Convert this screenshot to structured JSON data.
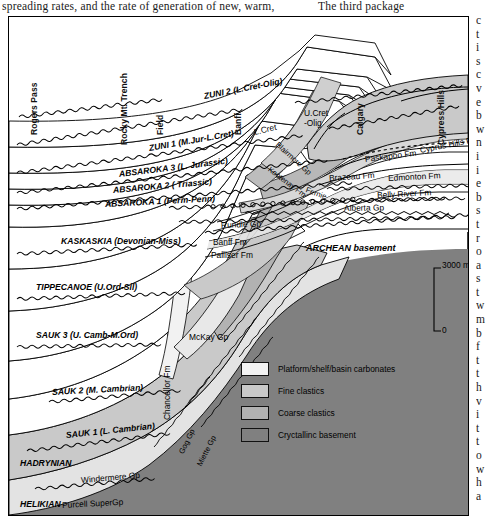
{
  "page": {
    "top_text_left": "spreading rates, and the rate of generation of new, warm,",
    "top_text_right": "The third package",
    "right_column": "c\nt\ni\ns\nc\nv\ne\nb\nw\nn\ni\ni\ne\nb\ns\nt\nr\no\na\ns\nt\nw\nm\nb\nf\nt\nt\nh\nv\ni\nt\nt\no\nw\nh\na"
  },
  "figure": {
    "locations": [
      {
        "label": "Rogers Pass",
        "x": 30,
        "y": 108
      },
      {
        "label": "Rocky Mt. Trench",
        "x": 120,
        "y": 118
      },
      {
        "label": "Field",
        "x": 156,
        "y": 108
      },
      {
        "label": "Banff",
        "x": 234,
        "y": 108
      },
      {
        "label": "Calgary",
        "x": 356,
        "y": 108
      },
      {
        "label": "Cypress Hills",
        "x": 437,
        "y": 118
      }
    ],
    "sequences": [
      {
        "label": "ZUNI 2 (L.Cret-Olig)",
        "x": 195,
        "y": 74,
        "rot": -11
      },
      {
        "label": "ZUNI 1 (M.Jur-L.Cret)",
        "x": 140,
        "y": 126,
        "rot": -10
      },
      {
        "label": "ABSAROKA 3 (L. Jurassic)",
        "x": 110,
        "y": 152,
        "rot": -7
      },
      {
        "label": "ABSAROKA 2 ( Triassic)",
        "x": 104,
        "y": 168,
        "rot": -5
      },
      {
        "label": "ABSAROKA 1 (Perm-Penn)",
        "x": 96,
        "y": 182,
        "rot": -3
      },
      {
        "label": "KASKASKIA (Devonian-Miss)",
        "x": 52,
        "y": 219,
        "rot": 0
      },
      {
        "label": "TIPPECANOE (U.Ord-Sil)",
        "x": 27,
        "y": 265,
        "rot": 0
      },
      {
        "label": "SAUK 3 (U. Camb-M.Ord)",
        "x": 27,
        "y": 313,
        "rot": 0
      },
      {
        "label": "SAUK 2 (M. Cambrian)",
        "x": 43,
        "y": 370,
        "rot": -3
      },
      {
        "label": "SAUK 1 (L. Cambrian)",
        "x": 57,
        "y": 413,
        "rot": -6
      },
      {
        "label": "HADRYNIAN",
        "x": 11,
        "y": 441,
        "rot": 0
      },
      {
        "label": "HELIKIAN",
        "x": 11,
        "y": 482,
        "rot": 0
      }
    ],
    "formations": [
      {
        "label": "U.Cret\n-Olig",
        "x": 295,
        "y": 92,
        "rot": 0,
        "class": "fm"
      },
      {
        "label": "L.Cret",
        "x": 245,
        "y": 110,
        "rot": -13,
        "class": "fm"
      },
      {
        "label": "Blairmore Gp",
        "x": 268,
        "y": 122,
        "rot": 42,
        "class": "fm small"
      },
      {
        "label": "Kootenay Fm",
        "x": 260,
        "y": 147,
        "rot": 37,
        "class": "fm small"
      },
      {
        "label": "Fernie",
        "x": 297,
        "y": 168,
        "rot": 20,
        "class": "fm small"
      },
      {
        "label": "Paskapoo Fm",
        "x": 356,
        "y": 137,
        "rot": -7,
        "class": "fm"
      },
      {
        "label": "Cyprus Hills Fm",
        "x": 411,
        "y": 128,
        "rot": -11,
        "class": "fm"
      },
      {
        "label": "Brazeau Fm",
        "x": 320,
        "y": 156,
        "rot": -4,
        "class": "fm"
      },
      {
        "label": "Edmonton Fm",
        "x": 379,
        "y": 156,
        "rot": -3,
        "class": "fm"
      },
      {
        "label": "Belly River Fm",
        "x": 368,
        "y": 173,
        "rot": -3,
        "class": "fm"
      },
      {
        "label": "Alberta Gp",
        "x": 335,
        "y": 186,
        "rot": -1,
        "class": "fm"
      },
      {
        "label": "Rundle Gp",
        "x": 212,
        "y": 203,
        "rot": -2,
        "class": "fm"
      },
      {
        "label": "Banff Fm",
        "x": 204,
        "y": 220,
        "rot": 0,
        "class": "fm"
      },
      {
        "label": "Palliser Fm",
        "x": 202,
        "y": 233,
        "rot": 0,
        "class": "fm"
      },
      {
        "label": "ARCHEAN basement",
        "x": 297,
        "y": 226,
        "rot": 0,
        "class": "fm archean"
      },
      {
        "label": "McKay Gp",
        "x": 180,
        "y": 315,
        "rot": 0,
        "class": "fm"
      },
      {
        "label": "Chancellor Fm",
        "x": 158,
        "y": 398,
        "rot": -90,
        "class": "fm"
      },
      {
        "label": "Gog Gp",
        "x": 172,
        "y": 432,
        "rot": -64,
        "class": "fm small"
      },
      {
        "label": "Miette Gp",
        "x": 190,
        "y": 444,
        "rot": -63,
        "class": "fm small"
      },
      {
        "label": "Windermere Gp",
        "x": 72,
        "y": 458,
        "rot": -5,
        "class": "fm"
      },
      {
        "label": "Purcell SuperGp",
        "x": 53,
        "y": 483,
        "rot": -3,
        "class": "fm"
      }
    ],
    "legend": {
      "items": [
        {
          "label": "Platform/shelf/basin carbonates",
          "color": "#f2f2f2"
        },
        {
          "label": "Fine clastics",
          "color": "#c9c9c9"
        },
        {
          "label": "Coarse clastics",
          "color": "#b2b2b2"
        },
        {
          "label": "Cryctallinc basement",
          "color": "#808080"
        }
      ]
    },
    "scale": {
      "top_label": "3000 m",
      "bottom_label": "0"
    },
    "colors": {
      "carbonate": "#f2f2f2",
      "fine_clastics": "#c9c9c9",
      "coarse_clastics": "#b2b2b2",
      "basement": "#808080",
      "line": "#000000",
      "white": "#ffffff"
    }
  }
}
